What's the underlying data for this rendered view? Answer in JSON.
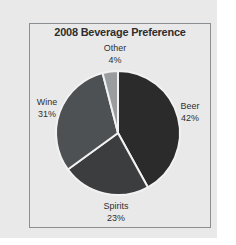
{
  "chart_data": {
    "type": "pie",
    "title": "2008 Beverage Preference",
    "categories": [
      "Beer",
      "Spirits",
      "Wine",
      "Other"
    ],
    "values": [
      42,
      23,
      31,
      4
    ],
    "value_unit": "%",
    "start_angle_deg": 0,
    "direction": "clockwise",
    "legend": "none",
    "labels_position": "outside",
    "slice_colors": [
      "#2b2b2b",
      "#3b3d3e",
      "#4e5153",
      "#9a9da0"
    ],
    "separator_color": "#f2f2f2",
    "slices": [
      {
        "name": "Beer",
        "percent": 42,
        "percent_label": "42%",
        "color": "#2b2b2b"
      },
      {
        "name": "Spirits",
        "percent": 23,
        "percent_label": "23%",
        "color": "#3b3d3e"
      },
      {
        "name": "Wine",
        "percent": 31,
        "percent_label": "31%",
        "color": "#4e5153"
      },
      {
        "name": "Other",
        "percent": 4,
        "percent_label": "4%",
        "color": "#9a9da0"
      }
    ]
  },
  "figure": {
    "title": "2008 Beverage Preference",
    "background_color": "#e9e9e9",
    "page_color": "#ffffff",
    "border_color": "#8c8f91",
    "title_color": "#2e2e2e",
    "label_color": "#2f2f2f"
  },
  "labels": {
    "other": {
      "name": "Other",
      "percent": "4%"
    },
    "beer": {
      "name": "Beer",
      "percent": "42%"
    },
    "wine": {
      "name": "Wine",
      "percent": "31%"
    },
    "spirits": {
      "name": "Spirits",
      "percent": "23%"
    }
  }
}
